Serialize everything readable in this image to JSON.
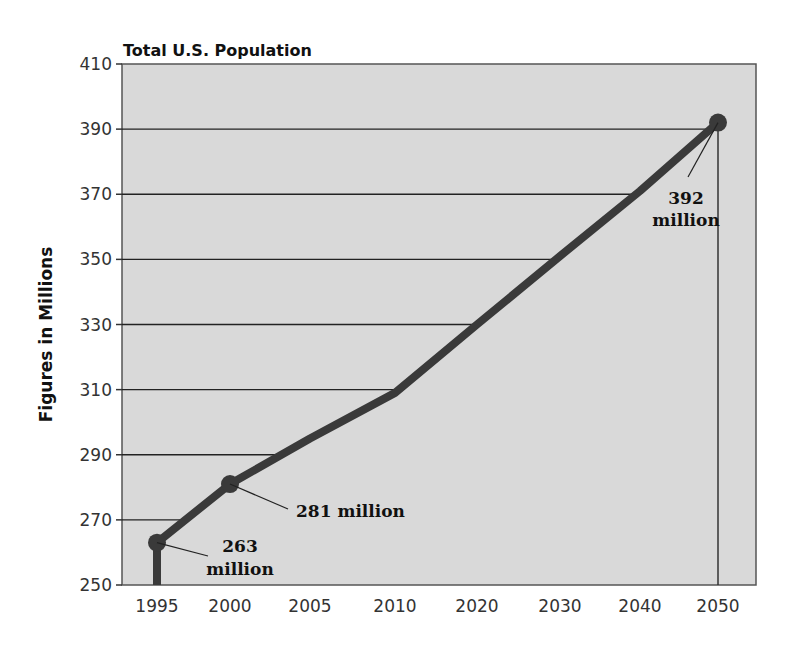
{
  "chart_data": {
    "type": "line",
    "title": "Total U.S. Population",
    "xlabel": "",
    "ylabel": "Figures in Millions",
    "categories": [
      "1995",
      "2000",
      "2005",
      "2010",
      "2020",
      "2030",
      "2040",
      "2050"
    ],
    "series": [
      {
        "name": "Total U.S. Population",
        "values": [
          263,
          281,
          295,
          309,
          330,
          351,
          371,
          392
        ]
      }
    ],
    "ylim": [
      250,
      410
    ],
    "yticks": [
      250,
      270,
      290,
      310,
      330,
      350,
      370,
      390,
      410
    ],
    "grid": true,
    "legend": "none",
    "annotations": [
      {
        "x": "1995",
        "value": 263,
        "line1": "263",
        "line2": "million"
      },
      {
        "x": "2000",
        "value": 281,
        "line1": "281 million",
        "line2": ""
      },
      {
        "x": "2050",
        "value": 392,
        "line1": "392",
        "line2": "million"
      }
    ],
    "colors": {
      "plot_bg": "#d9d9d9",
      "line": "#3a3a3a",
      "grid": "#222222"
    }
  }
}
